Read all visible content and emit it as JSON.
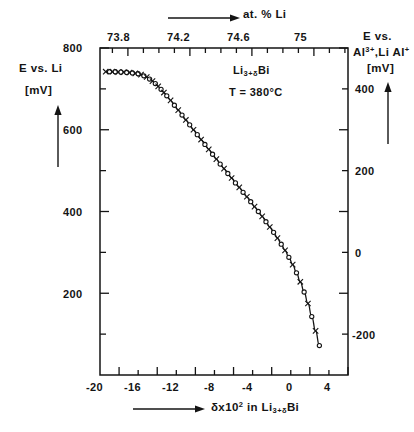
{
  "figure": {
    "background_color": "#ffffff",
    "line_color": "#141414"
  },
  "annotations": {
    "compound_prefix": "Li",
    "compound_sub": "3+δ",
    "compound_suffix": "Bi",
    "temperature": "T = 380°C"
  },
  "axes": {
    "top": {
      "title": "at. % Li",
      "title_arrow": "→",
      "ticks": [
        "73.8",
        "74.2",
        "74.6",
        "75"
      ],
      "tick_values": [
        73.8,
        74.2,
        74.6,
        75.0
      ],
      "range": [
        73.62,
        75.22
      ]
    },
    "left": {
      "title_line1": "E vs. Li",
      "title_line2": "[mV]",
      "title_arrow": "↑",
      "ticks": [
        "800",
        "600",
        "400",
        "200"
      ],
      "tick_values": [
        800,
        600,
        400,
        200
      ],
      "range": [
        0,
        800
      ],
      "unit": "mV"
    },
    "right": {
      "title_line1": "E vs.",
      "title_line2_a": "Al",
      "title_line2_sup1": "3+",
      "title_line2_b": ",Li Al",
      "title_line2_sup2": "+",
      "title_line3": "[mV]",
      "title_arrow": "↑",
      "ticks": [
        "400",
        "200",
        "0",
        "-200"
      ],
      "tick_values": [
        400,
        200,
        0,
        -200
      ],
      "range": [
        -400,
        400
      ],
      "unit": "mV"
    },
    "bottom": {
      "title_arrow": "→",
      "title_a": "δx10",
      "title_sup": "2",
      "title_b": " in Li",
      "title_sub": "3+δ",
      "title_c": "Bi",
      "ticks": [
        "-20",
        "-16",
        "-12",
        "-8",
        "-4",
        "0",
        "4"
      ],
      "tick_values": [
        -20,
        -16,
        -12,
        -8,
        -4,
        0,
        4
      ],
      "range": [
        -22,
        4
      ]
    }
  },
  "chart_data": {
    "type": "scatter",
    "title": "",
    "subtitle": "",
    "xlabel": "δx10² in Li₃₊δBi",
    "ylabel": "E vs. Li [mV]",
    "xlabel_top": "at. % Li",
    "ylabel_right": "E vs. Al³⁺,Li Al⁺ [mV]",
    "xlim": [
      -22,
      4
    ],
    "ylim": [
      0,
      800
    ],
    "xlim_top": [
      73.62,
      75.22
    ],
    "ylim_right": [
      -400,
      400
    ],
    "grid": false,
    "legend": null,
    "marker_styles": [
      "cross",
      "circle"
    ],
    "annotations": [
      "Li₃₊δBi",
      "T = 380°C"
    ],
    "series": [
      {
        "name": "E vs. Li (measured)",
        "x": [
          -21.4,
          -21.0,
          -20.7,
          -20.4,
          -20.1,
          -19.8,
          -19.5,
          -19.2,
          -18.9,
          -18.6,
          -18.3,
          -18.0,
          -17.7,
          -17.4,
          -17.1,
          -16.8,
          -16.5,
          -16.2,
          -15.9,
          -15.6,
          -15.3,
          -15.0,
          -14.6,
          -14.2,
          -13.8,
          -13.4,
          -13.0,
          -12.6,
          -12.2,
          -11.8,
          -11.4,
          -11.0,
          -10.6,
          -10.2,
          -9.8,
          -9.4,
          -9.0,
          -8.6,
          -8.2,
          -7.8,
          -7.4,
          -7.0,
          -6.6,
          -6.2,
          -5.8,
          -5.4,
          -5.0,
          -4.6,
          -4.2,
          -3.8,
          -3.4,
          -3.0,
          -2.6,
          -2.2,
          -1.8,
          -1.4,
          -1.0,
          -0.6,
          -0.2,
          0.2,
          0.6,
          1.0
        ],
        "y": [
          742,
          742,
          742,
          742,
          741,
          741,
          741,
          740,
          740,
          739,
          738,
          737,
          735,
          732,
          729,
          724,
          719,
          713,
          706,
          699,
          691,
          683,
          672,
          660,
          648,
          636,
          624,
          612,
          600,
          588,
          576,
          564,
          552,
          540,
          528,
          516,
          505,
          493,
          482,
          470,
          459,
          447,
          436,
          424,
          412,
          400,
          388,
          375,
          362,
          349,
          335,
          320,
          305,
          288,
          270,
          250,
          228,
          203,
          175,
          143,
          108,
          72
        ]
      }
    ]
  }
}
